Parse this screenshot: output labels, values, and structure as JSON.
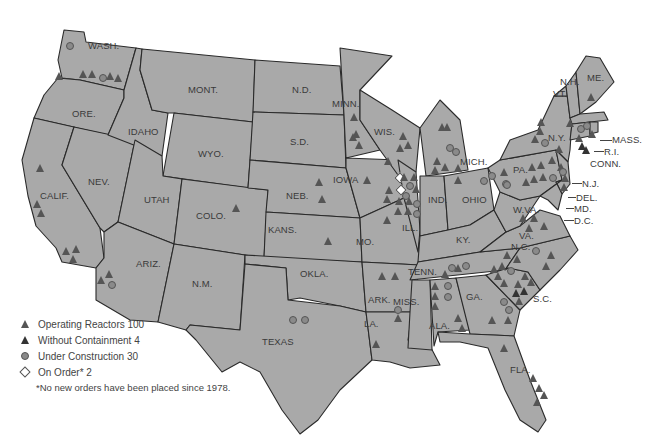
{
  "map": {
    "title": "U.S. Nuclear Power Reactors",
    "fill_color": "#a9a9a9",
    "border_color": "#2a2a2a",
    "background": "#ffffff",
    "state_labels": {
      "wash": "WASH.",
      "ore": "ORE.",
      "calif": "CALIF.",
      "nev": "NEV.",
      "idaho": "IDAHO",
      "mont": "MONT.",
      "wyo": "WYO.",
      "utah": "UTAH",
      "ariz": "ARIZ.",
      "colo": "COLO.",
      "nm": "N.M.",
      "nd": "N.D.",
      "sd": "S.D.",
      "neb": "NEB.",
      "kans": "KANS.",
      "okla": "OKLA.",
      "texas": "TEXAS",
      "minn": "MINN.",
      "iowa": "IOWA",
      "mo": "MO.",
      "ark": "ARK.",
      "la": "LA.",
      "wis": "WIS.",
      "ill": "ILL.",
      "mich": "MICH.",
      "ind": "IND.",
      "ohio": "OHIO",
      "ky": "KY.",
      "tenn": "TENN.",
      "miss": "MISS.",
      "ala": "ALA.",
      "ga": "GA.",
      "fla": "FLA.",
      "sc": "S.C.",
      "nc": "N.C.",
      "va": "VA.",
      "wva": "W.VA.",
      "pa": "PA.",
      "ny": "N.Y.",
      "vt": "VT.",
      "nh": "N.H.",
      "me": "ME.",
      "mass": "MASS.",
      "ri": "R.I.",
      "conn": "CONN.",
      "nj": "N.J.",
      "del": "DEL.",
      "md": "MD.",
      "dc": "D.C."
    }
  },
  "legend": {
    "items": [
      {
        "symbol": "triangle",
        "label": "Operating Reactors 100"
      },
      {
        "symbol": "triangle-dark",
        "label": "Without Containment 4"
      },
      {
        "symbol": "circle",
        "label": "Under Construction 30"
      },
      {
        "symbol": "diamond",
        "label": "On Order* 2"
      }
    ],
    "footnote": "*No new orders have been placed since 1978."
  },
  "counts": {
    "operating_reactors": 100,
    "without_containment": 4,
    "under_construction": 30,
    "on_order": 2
  }
}
